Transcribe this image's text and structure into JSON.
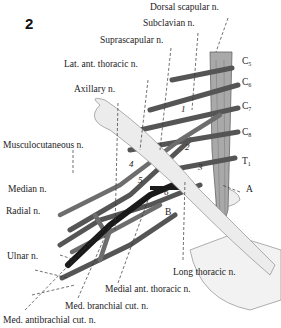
{
  "figure": {
    "number": "2",
    "labels_top": {
      "dorsal_scapular": "Dorsal scapular n.",
      "subclavian": "Subclavian n.",
      "suprascapular": "Suprascapular n.",
      "lat_ant_thoracic": "Lat. ant. thoracic n.",
      "axillary": "Axillary n."
    },
    "labels_left": {
      "musculocutaneous": "Musculocutaneous n.",
      "median": "Median n.",
      "radial": "Radial n.",
      "ulnar": "Ulnar n."
    },
    "labels_bottom": {
      "long_thoracic": "Long thoracic n.",
      "medial_ant_thoracic": "Medial ant. thoracic n.",
      "med_branchial_cut": "Med. branchial cut. n.",
      "med_antibrachial_cut": "Med. antibrachial cut. n."
    },
    "roots": [
      {
        "letter": "C",
        "sub": "5"
      },
      {
        "letter": "C",
        "sub": "6"
      },
      {
        "letter": "C",
        "sub": "7"
      },
      {
        "letter": "C",
        "sub": "8"
      },
      {
        "letter": "T",
        "sub": "1"
      }
    ],
    "markers": {
      "A": "A",
      "B": "B"
    },
    "numbers": [
      "1",
      "2",
      "3",
      "4",
      "5",
      "6"
    ]
  }
}
